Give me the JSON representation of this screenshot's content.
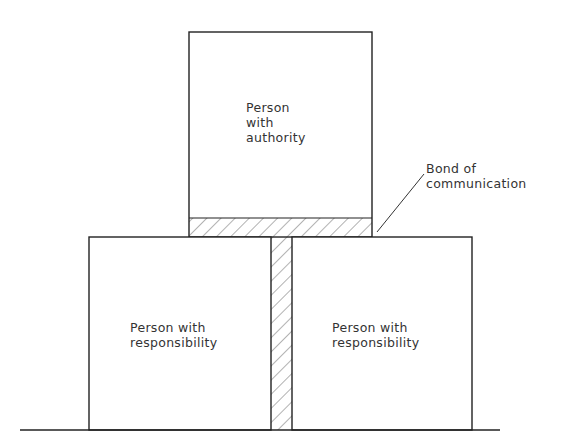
{
  "diagram": {
    "type": "block-structure",
    "top_box": {
      "line1": "Person",
      "line2": "with",
      "line3": "authority"
    },
    "left_box": {
      "line1": "Person with",
      "line2": "responsibility"
    },
    "right_box": {
      "line1": "Person with",
      "line2": "responsibility"
    },
    "annotation": {
      "line1": "Bond of",
      "line2": "communication"
    },
    "colors": {
      "stroke": "#222222",
      "hatch": "#555555",
      "background": "#ffffff"
    }
  }
}
